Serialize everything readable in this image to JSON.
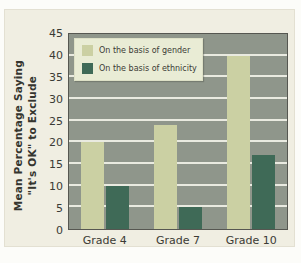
{
  "figure": {
    "y_axis_title_line1": "Mean Percentage Saying",
    "y_axis_title_line2": "\"It's OK\" to Exclude"
  },
  "chart_data": {
    "type": "bar",
    "categories": [
      "Grade 4",
      "Grade 7",
      "Grade 10"
    ],
    "series": [
      {
        "name": "On the basis of gender",
        "values": [
          20,
          24,
          40
        ],
        "color": "#cbd0a3"
      },
      {
        "name": "On the basis of ethnicity",
        "values": [
          10,
          5,
          17
        ],
        "color": "#3f6a57"
      }
    ],
    "title": "",
    "xlabel": "",
    "ylabel": "Mean Percentage Saying \"It's OK\" to Exclude",
    "ylim": [
      0,
      45
    ],
    "ytick_step": 5,
    "grid": true,
    "legend_position": "top-left",
    "plot_bg": "#8f968b",
    "grid_color": "#e9eae0",
    "figure_bg": "#f0eee2"
  }
}
